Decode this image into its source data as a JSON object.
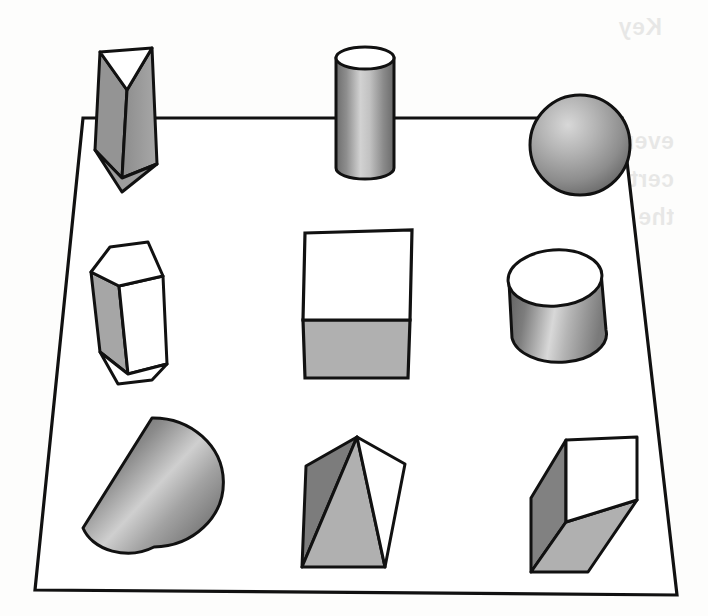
{
  "page": {
    "kind": "scanned-book-page",
    "background_color": "#fdfdfc",
    "ink_color": "#111111",
    "width": 708,
    "height": 616
  },
  "figure": {
    "name": "nine-geometric-solids",
    "platform": {
      "name": "platform-quadrilateral",
      "fill": "#ffffff",
      "stroke": "#111111",
      "stroke_width": 3,
      "points": "83,118 622,118 677,595 35,590"
    },
    "palette": {
      "outline": "#111111",
      "white_face": "#ffffff",
      "light_gray": "#b3b3b3",
      "mid_gray": "#9a9a9a",
      "dark_gray": "#6f6f6f",
      "shadow_gray": "#4d4d4d",
      "highlight": "#e6e6e6"
    },
    "rows": [
      {
        "name": "back-row",
        "solids": [
          {
            "id": "triangular-prism",
            "label": "triangular prism",
            "position": "back-left"
          },
          {
            "id": "narrow-cylinder",
            "label": "cylinder",
            "position": "back-center"
          },
          {
            "id": "sphere",
            "label": "sphere",
            "position": "back-right"
          }
        ]
      },
      {
        "name": "middle-row",
        "solids": [
          {
            "id": "hexagonal-prism",
            "label": "hexagonal prism",
            "position": "middle-left"
          },
          {
            "id": "cube",
            "label": "cube",
            "position": "middle-center"
          },
          {
            "id": "wide-cylinder",
            "label": "cylinder",
            "position": "middle-right"
          }
        ]
      },
      {
        "name": "front-row",
        "solids": [
          {
            "id": "cone",
            "label": "cone",
            "position": "front-left"
          },
          {
            "id": "pyramid",
            "label": "pyramid",
            "position": "front-center"
          },
          {
            "id": "rectangular-box",
            "label": "rectangular prism",
            "position": "front-right"
          }
        ]
      }
    ]
  },
  "bleed_through": {
    "note": "Faint mirrored text showing through from the reverse side of the sheet.",
    "mirrored": true,
    "lines": [
      {
        "text": "Key",
        "x": 46,
        "y": 14,
        "size": 23
      },
      {
        "text": "every shape, and of each size.",
        "x": 34,
        "y": 128,
        "size": 23
      },
      {
        "text": "certainly includes the points of",
        "x": 34,
        "y": 166,
        "size": 23
      },
      {
        "text": "the interior of the circle as well",
        "x": 34,
        "y": 204,
        "size": 23
      }
    ]
  }
}
